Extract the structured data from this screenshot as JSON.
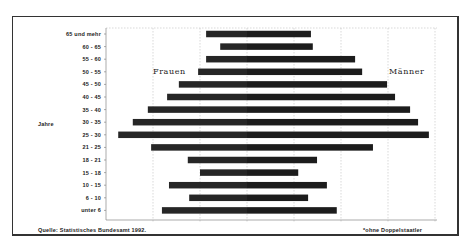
{
  "chart_data": {
    "type": "bar",
    "orientation": "horizontal",
    "subtype": "population-pyramid",
    "title": "",
    "ylabel": "Jahre",
    "xlabel": "",
    "categories": [
      "65 und mehr",
      "60 - 65",
      "55 - 60",
      "50 - 55",
      "45 - 50",
      "40 - 45",
      "35 - 40",
      "30 - 35",
      "25 - 30",
      "21 - 25",
      "18 - 21",
      "15 - 18",
      "10 - 15",
      "6 - 10",
      "unter 6"
    ],
    "series": [
      {
        "name": "Frauen",
        "side": "left",
        "values": [
          0.87,
          0.57,
          0.87,
          1.04,
          1.45,
          1.7,
          2.11,
          2.43,
          2.74,
          2.04,
          1.26,
          1.0,
          1.66,
          1.23,
          1.81
        ]
      },
      {
        "name": "Männer",
        "side": "right",
        "values": [
          1.36,
          1.4,
          2.3,
          2.45,
          2.98,
          3.15,
          3.47,
          3.64,
          3.87,
          2.68,
          1.49,
          1.09,
          1.7,
          1.3,
          1.91
        ]
      }
    ],
    "value_units": "grid intervals (no tick labels shown)",
    "xlim": [
      -2.0,
      4.0
    ],
    "grid": true,
    "gridlines_x": [
      -2,
      -1,
      0,
      1,
      2,
      3,
      4
    ],
    "legend": "inline labels (Frauen left, Männer right)",
    "annotations": [
      "Quelle: Statistisches Bundesamt 1992.",
      "*ohne Doppelstaatler"
    ]
  },
  "labels": {
    "frauen": "Frauen",
    "maenner": "Männer",
    "jahre": "Jahre",
    "source": "Quelle: Statistisches Bundesamt 1992.",
    "footnote": "*ohne Doppelstaatler"
  },
  "colors": {
    "bar": "#1c1c1c",
    "grid": "#bfbfbf",
    "frame": "#333333",
    "background": "#ffffff"
  }
}
